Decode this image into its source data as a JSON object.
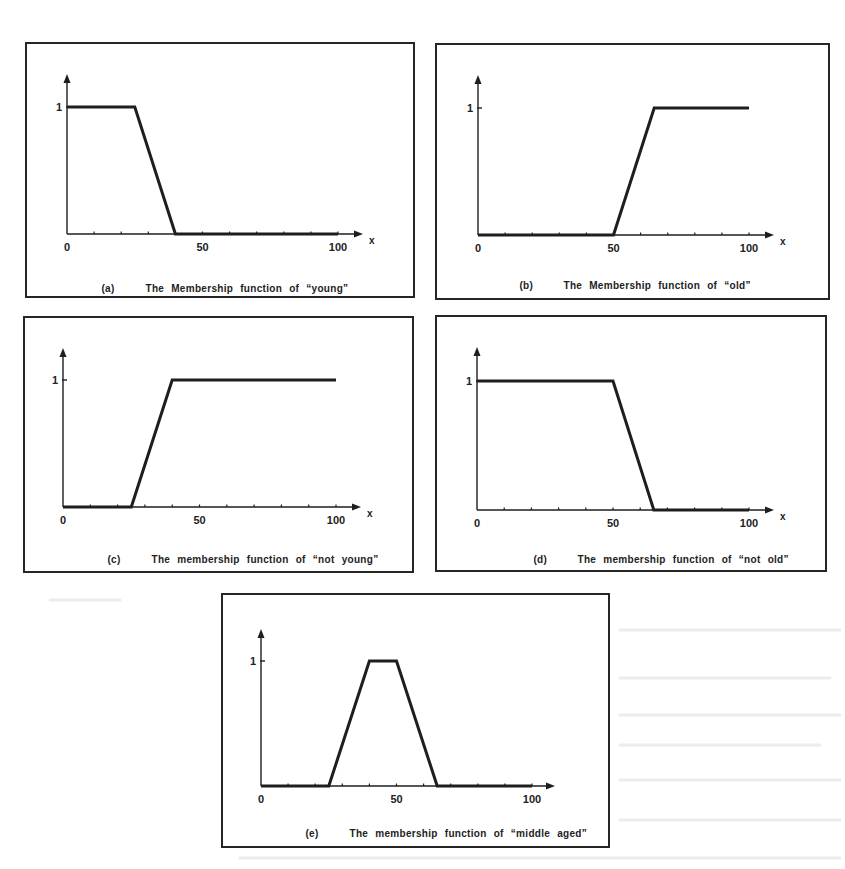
{
  "figure": {
    "panels": [
      {
        "id": "a",
        "letter": "(a)",
        "caption": "The Membership function of “young”",
        "frame": {
          "left": 25,
          "top": 42,
          "width": 390,
          "height": 256
        },
        "axis": {
          "origin_x": 40,
          "baseline_y": 190,
          "x_end": 311,
          "unit_top_y": 63,
          "y_arrow_top": 30,
          "x_arrow_end": 336
        },
        "x_label": "x",
        "caption_pos": {
          "left": 32,
          "top": 228
        }
      },
      {
        "id": "b",
        "letter": "(b)",
        "caption": "The Membership function of “old”",
        "frame": {
          "left": 435,
          "top": 43,
          "width": 395,
          "height": 257
        },
        "axis": {
          "origin_x": 41,
          "baseline_y": 190,
          "x_end": 312,
          "unit_top_y": 63,
          "y_arrow_top": 30,
          "x_arrow_end": 337
        },
        "x_label": "x",
        "caption_pos": {
          "left": 40,
          "top": 224
        }
      },
      {
        "id": "c",
        "letter": "(c)",
        "caption": "The membership function of “not young”",
        "frame": {
          "left": 23,
          "top": 316,
          "width": 391,
          "height": 257
        },
        "axis": {
          "origin_x": 38,
          "baseline_y": 189,
          "x_end": 311,
          "unit_top_y": 62,
          "y_arrow_top": 30,
          "x_arrow_end": 336
        },
        "x_label": "x",
        "caption_pos": {
          "left": 40,
          "top": 225
        }
      },
      {
        "id": "d",
        "letter": "(d)",
        "caption": "The membership function of “not old”",
        "frame": {
          "left": 435,
          "top": 315,
          "width": 392,
          "height": 257
        },
        "axis": {
          "origin_x": 40,
          "baseline_y": 193,
          "x_end": 312,
          "unit_top_y": 64,
          "y_arrow_top": 30,
          "x_arrow_end": 337
        },
        "x_label": "x",
        "caption_pos": {
          "left": 54,
          "top": 226
        }
      },
      {
        "id": "e",
        "letter": "(e)",
        "caption": "The membership function of “middle aged”",
        "frame": {
          "left": 221,
          "top": 593,
          "width": 389,
          "height": 255
        },
        "axis": {
          "origin_x": 38,
          "baseline_y": 191,
          "x_end": 309,
          "unit_top_y": 66,
          "y_arrow_top": 34,
          "x_arrow_end": 332
        },
        "x_label": "",
        "caption_pos": {
          "left": 40,
          "top": 222
        }
      }
    ],
    "x_ticks": [
      "0",
      "50",
      "100"
    ],
    "y_tick": "1",
    "line_color": "#1e1e1e",
    "frame_color": "#262626"
  },
  "chart_data": [
    {
      "type": "line",
      "title": "(a) The Membership function of “young”",
      "xlabel": "x",
      "ylabel": "",
      "xlim": [
        0,
        100
      ],
      "ylim": [
        0,
        1
      ],
      "x_tick_labels": [
        "0",
        "50",
        "100"
      ],
      "y_tick_labels": [
        "1"
      ],
      "x_minor_ticks_every": 10,
      "grid": false,
      "legend": null,
      "series": [
        {
          "name": "young",
          "x": [
            0,
            25,
            40,
            100
          ],
          "y": [
            1,
            1,
            0,
            0
          ]
        }
      ]
    },
    {
      "type": "line",
      "title": "(b) The Membership function of “old”",
      "xlabel": "x",
      "ylabel": "",
      "xlim": [
        0,
        100
      ],
      "ylim": [
        0,
        1
      ],
      "x_tick_labels": [
        "0",
        "50",
        "100"
      ],
      "y_tick_labels": [
        "1"
      ],
      "x_minor_ticks_every": 10,
      "grid": false,
      "legend": null,
      "series": [
        {
          "name": "old",
          "x": [
            0,
            50,
            65,
            100
          ],
          "y": [
            0,
            0,
            1,
            1
          ]
        }
      ]
    },
    {
      "type": "line",
      "title": "(c) The membership function of “not young”",
      "xlabel": "x",
      "ylabel": "",
      "xlim": [
        0,
        100
      ],
      "ylim": [
        0,
        1
      ],
      "x_tick_labels": [
        "0",
        "50",
        "100"
      ],
      "y_tick_labels": [
        "1"
      ],
      "x_minor_ticks_every": 10,
      "grid": false,
      "legend": null,
      "series": [
        {
          "name": "not young",
          "x": [
            0,
            25,
            40,
            100
          ],
          "y": [
            0,
            0,
            1,
            1
          ]
        }
      ]
    },
    {
      "type": "line",
      "title": "(d) The membership function of “not old”",
      "xlabel": "x",
      "ylabel": "",
      "xlim": [
        0,
        100
      ],
      "ylim": [
        0,
        1
      ],
      "x_tick_labels": [
        "0",
        "50",
        "100"
      ],
      "y_tick_labels": [
        "1"
      ],
      "x_minor_ticks_every": 10,
      "grid": false,
      "legend": null,
      "series": [
        {
          "name": "not old",
          "x": [
            0,
            50,
            65,
            100
          ],
          "y": [
            1,
            1,
            0,
            0
          ]
        }
      ]
    },
    {
      "type": "line",
      "title": "(e) The membership function of “middle aged”",
      "xlabel": "",
      "ylabel": "",
      "xlim": [
        0,
        100
      ],
      "ylim": [
        0,
        1
      ],
      "x_tick_labels": [
        "0",
        "50",
        "100"
      ],
      "y_tick_labels": [
        "1"
      ],
      "x_minor_ticks_every": 10,
      "grid": false,
      "legend": null,
      "series": [
        {
          "name": "middle aged",
          "x": [
            0,
            25,
            40,
            50,
            65,
            100
          ],
          "y": [
            0,
            0,
            1,
            1,
            0,
            0
          ]
        }
      ]
    }
  ]
}
